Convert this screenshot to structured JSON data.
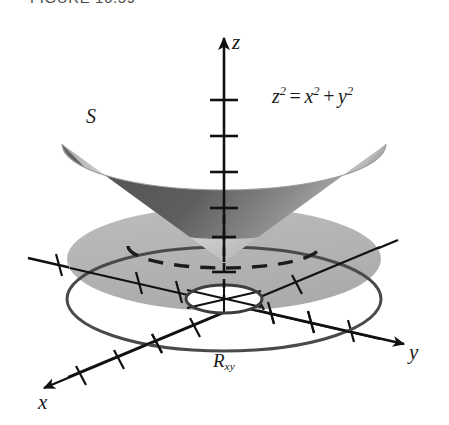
{
  "figure": {
    "caption": "FIGURE 16.59",
    "surface_label": "S",
    "region_label_base": "R",
    "region_label_sub": "xy",
    "equation": {
      "lhs_base": "z",
      "lhs_exp": "2",
      "equals": "=",
      "term1_base": "x",
      "term1_exp": "2",
      "plus": "+",
      "term2_base": "y",
      "term2_exp": "2",
      "full_text": "z2 = x2 + y2"
    },
    "axes": [
      {
        "name": "z",
        "label": "z",
        "direction": "up",
        "tick_count": 6,
        "has_arrow": true,
        "hidden_segment": "dashed below cone base"
      },
      {
        "name": "x",
        "label": "x",
        "direction": "down-left",
        "tick_count": 7,
        "has_arrow": true,
        "hidden_segment": "none"
      },
      {
        "name": "y",
        "label": "y",
        "direction": "right-down",
        "tick_count": 7,
        "has_arrow": true,
        "hidden_segment": "none"
      }
    ],
    "colors": {
      "cone_inner_dark": "#575757",
      "cone_inner_mid": "#6e6e6e",
      "cone_outer_light": "#c9c9c9",
      "cone_outer_mid": "#a8a8a8",
      "annulus_fill": "#b5b5b5",
      "annulus_edge": "#4a4a4a",
      "hole_fill": "#ffffff",
      "axis_stroke": "#111111",
      "background": "#ffffff",
      "caption_text": "#4b4b4b",
      "label_text": "#1a1a1a"
    },
    "elements": {
      "cone_surface": "upward-opening circular cone with apex at origin",
      "base_ellipse_hidden": "dashed rear half of cone base circle",
      "region": "annulus (washer) in the xy-plane with central elliptical hole",
      "hole": "white elliptical hole at center of annulus"
    }
  }
}
